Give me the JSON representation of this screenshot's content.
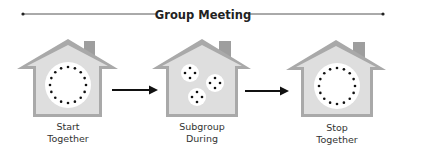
{
  "title": "Group Meeting",
  "colors": {
    "house_outline": "#a9a9a9",
    "house_fill": "#dedede",
    "chimney": "#9e9e9e",
    "circle_fill": "#ffffff",
    "dot": "#111111",
    "arrow": "#111111",
    "line": "#555555"
  },
  "stages": [
    {
      "label_line1": "Start",
      "label_line2": "Together",
      "layout": "single-circle",
      "dots": 16
    },
    {
      "label_line1": "Subgroup",
      "label_line2": "During",
      "layout": "three-small-circles",
      "dots_per_group": 4
    },
    {
      "label_line1": "Stop",
      "label_line2": "Together",
      "layout": "single-circle",
      "dots": 16
    }
  ],
  "arrows": [
    {
      "from": "Start Together",
      "to": "Subgroup During"
    },
    {
      "from": "Subgroup During",
      "to": "Stop Together"
    }
  ]
}
